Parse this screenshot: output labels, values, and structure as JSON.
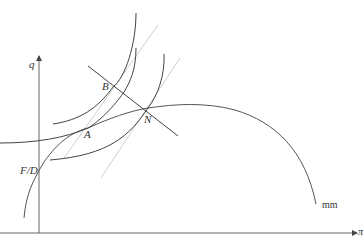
{
  "diagram": {
    "axes": {
      "y_label": "q",
      "x_label": "π"
    },
    "curves": {
      "mm_label": "mm"
    },
    "points": {
      "A": "A",
      "B": "B",
      "N": "N",
      "FD": "F/D"
    },
    "colors": {
      "axis": "#555555",
      "curve": "#444444",
      "guide": "#c8c8c8"
    }
  }
}
